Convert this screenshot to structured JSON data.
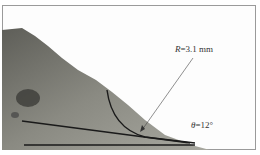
{
  "figure": {
    "radius_label": {
      "symbol": "R",
      "value": "=3.1 mm"
    },
    "angle_label": {
      "symbol": "θ",
      "value": "=12°"
    },
    "colors": {
      "surface": "#7a7a72",
      "dark": "#3c3c38",
      "line": "#1a1a1a"
    }
  }
}
